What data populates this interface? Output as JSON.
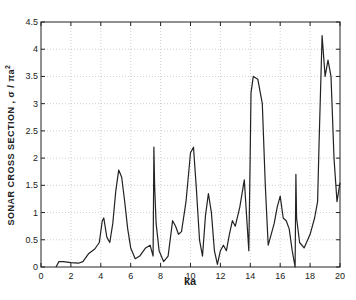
{
  "chart_data": {
    "type": "line",
    "title": "",
    "xlabel": "ka",
    "ylabel": "SONAR CROSS SECTION , σ / πa²",
    "xlim": [
      0,
      20
    ],
    "ylim": [
      0,
      4.5
    ],
    "xticks": [
      0,
      2,
      4,
      6,
      8,
      10,
      12,
      14,
      16,
      18,
      20
    ],
    "yticks": [
      0,
      0.5,
      1,
      1.5,
      2,
      2.5,
      3,
      3.5,
      4,
      4.5
    ],
    "grid": true,
    "legend": null,
    "series": [
      {
        "name": "sonar cross section",
        "x": [
          1.0,
          1.2,
          1.5,
          2.0,
          2.5,
          2.8,
          3.2,
          3.6,
          3.9,
          4.1,
          4.2,
          4.4,
          4.6,
          4.8,
          5.0,
          5.2,
          5.4,
          5.6,
          5.8,
          6.0,
          6.3,
          6.6,
          7.0,
          7.3,
          7.5,
          7.55,
          7.6,
          7.7,
          7.9,
          8.2,
          8.5,
          8.8,
          9.0,
          9.2,
          9.4,
          9.7,
          10.0,
          10.2,
          10.4,
          10.6,
          10.8,
          11.0,
          11.2,
          11.4,
          11.6,
          11.8,
          12.0,
          12.2,
          12.4,
          12.6,
          12.8,
          13.0,
          13.3,
          13.6,
          13.9,
          14.0,
          14.05,
          14.2,
          14.5,
          14.8,
          15.0,
          15.2,
          15.4,
          15.6,
          15.8,
          16.0,
          16.2,
          16.4,
          16.6,
          16.8,
          17.0,
          17.05,
          17.1,
          17.3,
          17.6,
          18.0,
          18.3,
          18.5,
          18.6,
          18.8,
          19.0,
          19.2,
          19.4,
          19.6,
          19.8,
          20.0
        ],
        "y": [
          0.0,
          0.1,
          0.1,
          0.08,
          0.07,
          0.1,
          0.25,
          0.33,
          0.45,
          0.85,
          0.9,
          0.55,
          0.45,
          0.8,
          1.4,
          1.78,
          1.65,
          1.2,
          0.7,
          0.35,
          0.15,
          0.2,
          0.35,
          0.4,
          0.2,
          2.2,
          1.5,
          0.8,
          0.3,
          0.1,
          0.2,
          0.85,
          0.75,
          0.6,
          0.65,
          1.2,
          2.1,
          2.2,
          1.4,
          0.5,
          0.2,
          0.95,
          1.35,
          1.0,
          0.3,
          0.05,
          0.3,
          0.4,
          0.3,
          0.6,
          0.85,
          0.75,
          1.1,
          1.6,
          0.3,
          2.2,
          3.2,
          3.5,
          3.45,
          3.0,
          1.5,
          0.4,
          0.6,
          0.8,
          1.1,
          1.3,
          0.9,
          0.85,
          0.7,
          0.3,
          0.0,
          1.7,
          0.9,
          0.45,
          0.35,
          0.6,
          0.9,
          1.2,
          2.3,
          4.25,
          3.5,
          3.8,
          3.5,
          2.0,
          1.2,
          1.55
        ]
      }
    ]
  }
}
